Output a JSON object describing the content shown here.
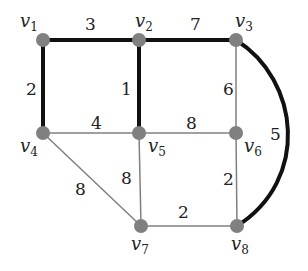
{
  "graph": {
    "nodes": [
      {
        "id": "v1",
        "label": "v",
        "sub": "1"
      },
      {
        "id": "v2",
        "label": "v",
        "sub": "2"
      },
      {
        "id": "v3",
        "label": "v",
        "sub": "3"
      },
      {
        "id": "v4",
        "label": "v",
        "sub": "4"
      },
      {
        "id": "v5",
        "label": "v",
        "sub": "5"
      },
      {
        "id": "v6",
        "label": "v",
        "sub": "6"
      },
      {
        "id": "v7",
        "label": "v",
        "sub": "7"
      },
      {
        "id": "v8",
        "label": "v",
        "sub": "8"
      }
    ],
    "edges": [
      {
        "from": "v1",
        "to": "v2",
        "weight": "3",
        "highlighted": true
      },
      {
        "from": "v2",
        "to": "v3",
        "weight": "7",
        "highlighted": true
      },
      {
        "from": "v1",
        "to": "v4",
        "weight": "2",
        "highlighted": true
      },
      {
        "from": "v2",
        "to": "v5",
        "weight": "1",
        "highlighted": true
      },
      {
        "from": "v3",
        "to": "v8",
        "weight": "5",
        "highlighted": true
      },
      {
        "from": "v3",
        "to": "v6",
        "weight": "6",
        "highlighted": false
      },
      {
        "from": "v4",
        "to": "v5",
        "weight": "4",
        "highlighted": false
      },
      {
        "from": "v5",
        "to": "v6",
        "weight": "8",
        "highlighted": false
      },
      {
        "from": "v4",
        "to": "v7",
        "weight": "8",
        "highlighted": false
      },
      {
        "from": "v5",
        "to": "v7",
        "weight": "8",
        "highlighted": false
      },
      {
        "from": "v6",
        "to": "v8",
        "weight": "2",
        "highlighted": false
      },
      {
        "from": "v7",
        "to": "v8",
        "weight": "2",
        "highlighted": false
      }
    ]
  },
  "colors": {
    "node": "#808080",
    "highlighted_edge": "#111111",
    "normal_edge": "#808080"
  }
}
